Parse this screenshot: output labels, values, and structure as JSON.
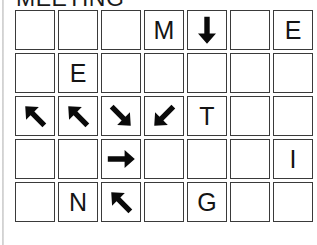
{
  "puzzle": {
    "title": "MEETING",
    "columns": 7,
    "rows": 5,
    "ink_color": "#0a0a0a",
    "border_color": "#3a3a3a",
    "background_color": "#ffffff",
    "cells": [
      [
        {
          "type": "empty",
          "value": ""
        },
        {
          "type": "empty",
          "value": ""
        },
        {
          "type": "empty",
          "value": ""
        },
        {
          "type": "letter",
          "value": "M"
        },
        {
          "type": "arrow",
          "value": "arrow-down-icon",
          "glyph": "↓"
        },
        {
          "type": "empty",
          "value": ""
        },
        {
          "type": "letter",
          "value": "E"
        }
      ],
      [
        {
          "type": "empty",
          "value": ""
        },
        {
          "type": "letter",
          "value": "E"
        },
        {
          "type": "empty",
          "value": ""
        },
        {
          "type": "empty",
          "value": ""
        },
        {
          "type": "empty",
          "value": ""
        },
        {
          "type": "empty",
          "value": ""
        },
        {
          "type": "empty",
          "value": ""
        }
      ],
      [
        {
          "type": "arrow",
          "value": "arrow-up-right-icon",
          "glyph": "↗"
        },
        {
          "type": "arrow",
          "value": "arrow-up-right-icon",
          "glyph": "↗"
        },
        {
          "type": "arrow",
          "value": "arrow-down-right-icon",
          "glyph": "↘"
        },
        {
          "type": "arrow",
          "value": "arrow-down-left-icon",
          "glyph": "↙"
        },
        {
          "type": "letter",
          "value": "T"
        },
        {
          "type": "empty",
          "value": ""
        },
        {
          "type": "empty",
          "value": ""
        }
      ],
      [
        {
          "type": "empty",
          "value": ""
        },
        {
          "type": "empty",
          "value": ""
        },
        {
          "type": "arrow",
          "value": "arrow-right-icon",
          "glyph": "→"
        },
        {
          "type": "empty",
          "value": ""
        },
        {
          "type": "empty",
          "value": ""
        },
        {
          "type": "empty",
          "value": ""
        },
        {
          "type": "letter",
          "value": "I"
        }
      ],
      [
        {
          "type": "empty",
          "value": ""
        },
        {
          "type": "letter",
          "value": "N"
        },
        {
          "type": "arrow",
          "value": "arrow-up-right-icon",
          "glyph": "↗"
        },
        {
          "type": "empty",
          "value": ""
        },
        {
          "type": "letter",
          "value": "G"
        },
        {
          "type": "empty",
          "value": ""
        },
        {
          "type": "empty",
          "value": ""
        }
      ]
    ]
  }
}
